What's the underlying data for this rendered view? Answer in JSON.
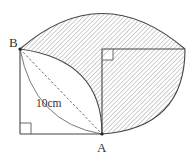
{
  "diagram": {
    "points": {
      "A": "A",
      "B": "B"
    },
    "length_label": "10cm",
    "colors": {
      "stroke": "#444444",
      "hatch": "#8a8a8a",
      "background": "#ffffff"
    }
  }
}
